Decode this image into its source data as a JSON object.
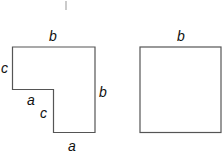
{
  "diagram": {
    "l_shape": {
      "labels": {
        "top": "b",
        "left": "c",
        "step_horizontal": "a",
        "step_vertical": "c",
        "bottom": "a",
        "right": "b"
      }
    },
    "square": {
      "labels": {
        "top": "b"
      }
    }
  }
}
